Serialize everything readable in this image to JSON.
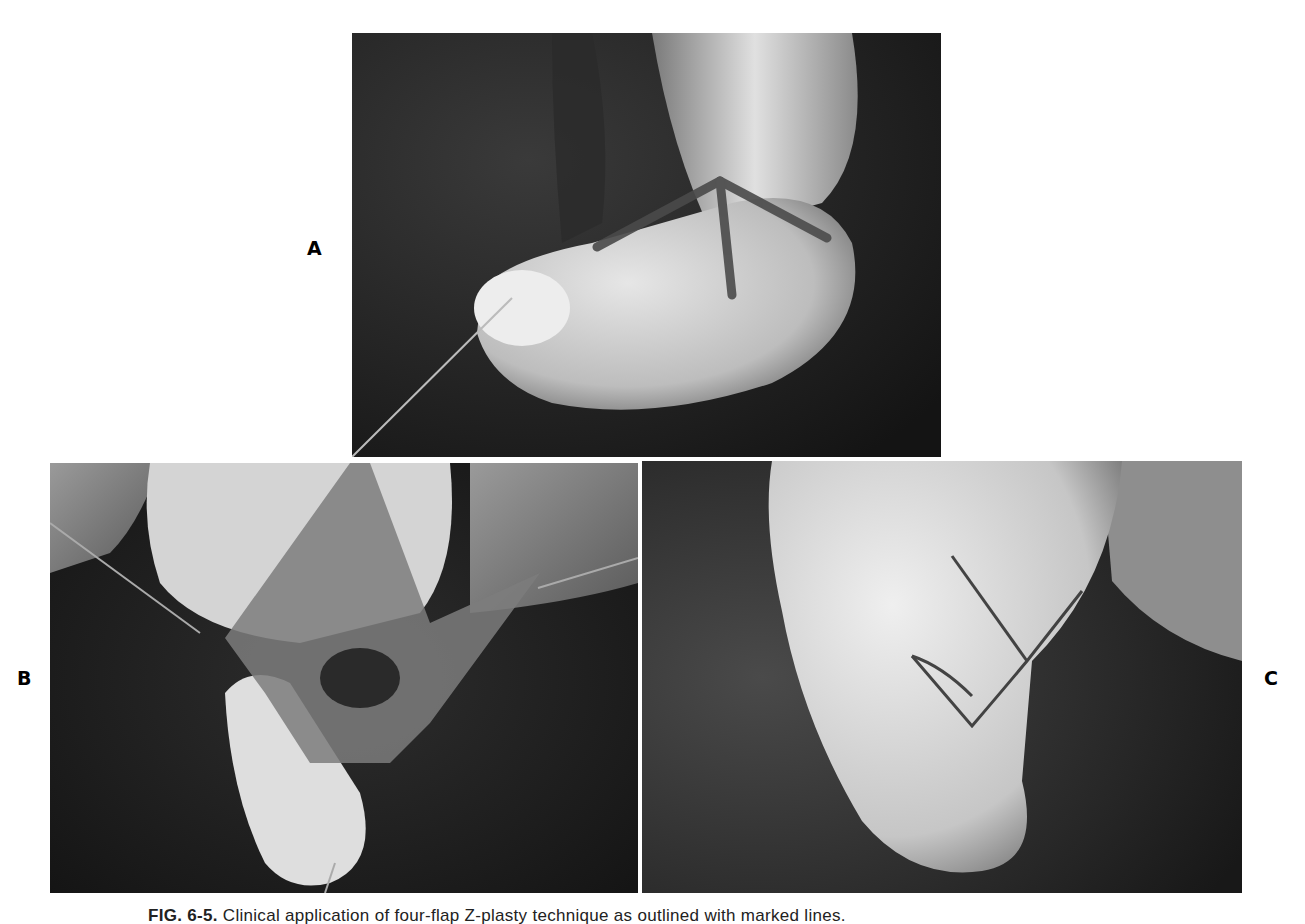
{
  "figure": {
    "panels": [
      {
        "id": "A",
        "label": "A",
        "description": "Thumb web with four-flap Z-plasty marked lines, traction suture at thumb tip"
      },
      {
        "id": "B",
        "label": "B",
        "description": "Flaps elevated intraoperatively with hooks retracting"
      },
      {
        "id": "C",
        "label": "C",
        "description": "Flaps transposed and sutured"
      }
    ],
    "caption": {
      "prefix": "FIG. 6-5.",
      "text": "Clinical application of four-flap Z-plasty technique as outlined with marked lines."
    }
  },
  "colors": {
    "background": "#ffffff",
    "photo_dark": "#1e1e1e",
    "photo_skin": "#d8d8d8",
    "marking": "#4a4a4a"
  }
}
